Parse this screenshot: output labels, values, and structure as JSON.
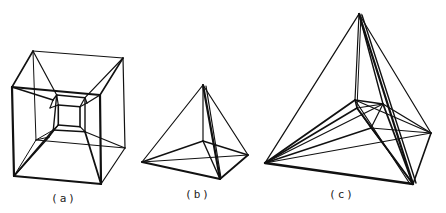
{
  "figure": {
    "stroke_color": "#111111",
    "background": "#ffffff",
    "panels": [
      {
        "id": "a",
        "caption": "(a)",
        "caption_pos": [
          64,
          192
        ],
        "description": "Tesseract (hypercube) wireframe projection",
        "edges": [
          [
            [
              12,
              87
            ],
            [
              100,
              95
            ],
            2.2
          ],
          [
            [
              100,
              95
            ],
            [
              101,
              184
            ],
            2.2
          ],
          [
            [
              101,
              184
            ],
            [
              14,
              176
            ],
            2.2
          ],
          [
            [
              14,
              176
            ],
            [
              12,
              87
            ],
            2.2
          ],
          [
            [
              33,
              51
            ],
            [
              123,
              58
            ],
            1.2
          ],
          [
            [
              123,
              58
            ],
            [
              125,
              148
            ],
            1.2
          ],
          [
            [
              125,
              148
            ],
            [
              101,
              184
            ],
            1.2
          ],
          [
            [
              33,
              51
            ],
            [
              12,
              87
            ],
            1.6
          ],
          [
            [
              123,
              58
            ],
            [
              100,
              95
            ],
            1.6
          ],
          [
            [
              33,
              51
            ],
            [
              36,
              140
            ],
            1.0
          ],
          [
            [
              36,
              140
            ],
            [
              125,
              148
            ],
            1.0
          ],
          [
            [
              36,
              140
            ],
            [
              14,
              176
            ],
            1.0
          ],
          [
            [
              56.7,
              95
            ],
            [
              85,
              97.7
            ],
            1.4
          ],
          [
            [
              85,
              97.7
            ],
            [
              85,
              131.7
            ],
            1.4
          ],
          [
            [
              85,
              131.7
            ],
            [
              53.3,
              130
            ],
            1.4
          ],
          [
            [
              53.3,
              130
            ],
            [
              56.7,
              95
            ],
            1.4
          ],
          [
            [
              58.3,
              105
            ],
            [
              80,
              106.7
            ],
            1.6
          ],
          [
            [
              80,
              106.7
            ],
            [
              80,
              126.7
            ],
            1.6
          ],
          [
            [
              80,
              126.7
            ],
            [
              58.3,
              125
            ],
            1.6
          ],
          [
            [
              58.3,
              125
            ],
            [
              58.3,
              105
            ],
            1.6
          ],
          [
            [
              56.7,
              95
            ],
            [
              58.3,
              105
            ],
            1.2
          ],
          [
            [
              85,
              97.7
            ],
            [
              80,
              106.7
            ],
            1.2
          ],
          [
            [
              85,
              131.7
            ],
            [
              80,
              126.7
            ],
            1.2
          ],
          [
            [
              53.3,
              130
            ],
            [
              58.3,
              125
            ],
            1.2
          ],
          [
            [
              12,
              87
            ],
            [
              53,
              100
            ],
            1.6
          ],
          [
            [
              53,
              100
            ],
            [
              56.7,
              95
            ],
            1.4
          ],
          [
            [
              53,
              100
            ],
            [
              50,
              108
            ],
            1.2
          ],
          [
            [
              50,
              108
            ],
            [
              58.3,
              105
            ],
            1.2
          ],
          [
            [
              100,
              95
            ],
            [
              87,
              103
            ],
            1.4
          ],
          [
            [
              87,
              103
            ],
            [
              85,
              97.7
            ],
            1.2
          ],
          [
            [
              87,
              103
            ],
            [
              80,
              106.7
            ],
            1.2
          ],
          [
            [
              33,
              51
            ],
            [
              56.7,
              95
            ],
            1.2
          ],
          [
            [
              123,
              58
            ],
            [
              85,
              97.7
            ],
            1.2
          ],
          [
            [
              14,
              176
            ],
            [
              53.3,
              130
            ],
            1.8
          ],
          [
            [
              14,
              176
            ],
            [
              49,
              137
            ],
            1.2
          ],
          [
            [
              49,
              137
            ],
            [
              58.3,
              125
            ],
            1.2
          ],
          [
            [
              101,
              184
            ],
            [
              85,
              131.7
            ],
            1.8
          ],
          [
            [
              125,
              148
            ],
            [
              85,
              131.7
            ],
            1.2
          ],
          [
            [
              36,
              140
            ],
            [
              53.3,
              130
            ],
            1.0
          ],
          [
            [
              53.3,
              130
            ],
            [
              49,
              137
            ],
            1.0
          ],
          [
            [
              49,
              137
            ],
            [
              36,
              140
            ],
            1.0
          ]
        ]
      },
      {
        "id": "b",
        "caption": "(b)",
        "caption_pos": [
          198,
          188
        ],
        "description": "4-simplex (pentachoron) wireframe projection",
        "edges": [
          [
            [
              203,
              85
            ],
            [
              142,
              162
            ],
            1.2
          ],
          [
            [
              203,
              85
            ],
            [
              248,
              155
            ],
            1.2
          ],
          [
            [
              203,
              85
            ],
            [
              203,
              141
            ],
            1.2
          ],
          [
            [
              203,
              85
            ],
            [
              220,
              179
            ],
            2.2
          ],
          [
            [
              206,
              86
            ],
            [
              221,
              178
            ],
            1.2
          ],
          [
            [
              142,
              162
            ],
            [
              248,
              155
            ],
            1.0
          ],
          [
            [
              142,
              162
            ],
            [
              203,
              141
            ],
            1.4
          ],
          [
            [
              142,
              162
            ],
            [
              220,
              179
            ],
            2.0
          ],
          [
            [
              203,
              141
            ],
            [
              248,
              155
            ],
            1.4
          ],
          [
            [
              203,
              141
            ],
            [
              220,
              179
            ],
            1.4
          ],
          [
            [
              248,
              155
            ],
            [
              220,
              179
            ],
            1.8
          ]
        ]
      },
      {
        "id": "c",
        "caption": "(c)",
        "caption_pos": [
          342,
          188
        ],
        "description": "Higher-dimensional simplex wireframe projection",
        "edges": [
          [
            [
              359,
              14
            ],
            [
              265,
              163
            ],
            1.4
          ],
          [
            [
              359,
              14
            ],
            [
              431,
              133
            ],
            1.2
          ],
          [
            [
              359,
              14
            ],
            [
              413,
              184
            ],
            2.2
          ],
          [
            [
              362,
              15
            ],
            [
              416,
              183
            ],
            1.4
          ],
          [
            [
              359,
              14
            ],
            [
              355,
              100
            ],
            1.2
          ],
          [
            [
              359,
              14
            ],
            [
              383,
              104
            ],
            1.4
          ],
          [
            [
              361,
              14
            ],
            [
              357,
              108
            ],
            1.0
          ],
          [
            [
              265,
              163
            ],
            [
              431,
              133
            ],
            1.2
          ],
          [
            [
              265,
              163
            ],
            [
              413,
              184
            ],
            2.4
          ],
          [
            [
              265,
              163
            ],
            [
              355,
              100
            ],
            1.8
          ],
          [
            [
              265,
              163
            ],
            [
              357,
              108
            ],
            1.6
          ],
          [
            [
              265,
              163
            ],
            [
              371,
              128
            ],
            1.4
          ],
          [
            [
              265,
              163
            ],
            [
              383,
              104
            ],
            1.2
          ],
          [
            [
              355,
              100
            ],
            [
              383,
              104
            ],
            1.6
          ],
          [
            [
              355,
              100
            ],
            [
              357,
              108
            ],
            1.4
          ],
          [
            [
              357,
              108
            ],
            [
              383,
              104
            ],
            1.2
          ],
          [
            [
              355,
              100
            ],
            [
              431,
              133
            ],
            1.2
          ],
          [
            [
              383,
              104
            ],
            [
              431,
              133
            ],
            1.4
          ],
          [
            [
              357,
              108
            ],
            [
              371,
              128
            ],
            1.2
          ],
          [
            [
              371,
              128
            ],
            [
              383,
              104
            ],
            1.2
          ],
          [
            [
              357,
              108
            ],
            [
              413,
              184
            ],
            2.0
          ],
          [
            [
              355,
              100
            ],
            [
              410,
              184
            ],
            1.2
          ],
          [
            [
              383,
              104
            ],
            [
              413,
              184
            ],
            1.8
          ],
          [
            [
              371,
              128
            ],
            [
              431,
              133
            ],
            1.2
          ],
          [
            [
              431,
              133
            ],
            [
              413,
              184
            ],
            1.6
          ],
          [
            [
              371,
              128
            ],
            [
              413,
              184
            ],
            1.2
          ]
        ]
      }
    ]
  }
}
